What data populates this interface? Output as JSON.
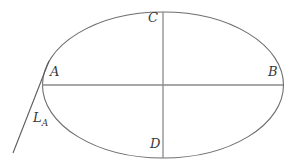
{
  "figure": {
    "type": "geometry-diagram",
    "width": 295,
    "height": 166,
    "background_color": "#ffffff"
  },
  "labels": {
    "left_vertex": "A",
    "right_vertex": "B",
    "top_covertex": "C",
    "bottom_covertex": "D",
    "tangent_line": "L",
    "tangent_line_subscript": "A"
  },
  "colors": {
    "ellipse_stroke": "#6e6e6e",
    "axis_stroke": "#8a8a8a",
    "tangent_stroke": "#5c5c5c",
    "label_text": "#3a3a3a"
  },
  "geometry": {
    "ellipse": {
      "cx": 163,
      "cy": 85,
      "rx": 120.5,
      "ry": 73
    },
    "major_axis": {
      "x1": 42,
      "y1": 85,
      "x2": 283,
      "y2": 85
    },
    "minor_axis": {
      "x1": 163,
      "y1": 12,
      "x2": 163,
      "y2": 158
    },
    "tangent": {
      "x1": 49,
      "y1": 61,
      "x2": 13,
      "y2": 153
    },
    "stroke_width": 1.1
  }
}
